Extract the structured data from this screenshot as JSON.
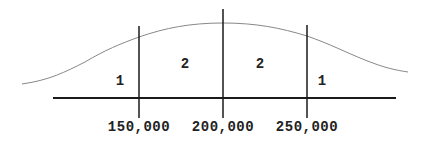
{
  "diagram": {
    "type": "normal-distribution-regions",
    "colors": {
      "line": "#1a1a1a",
      "curve": "#888888",
      "text": "#222222"
    },
    "ticks": [
      {
        "label": "150,000",
        "x": 139
      },
      {
        "label": "200,000",
        "x": 223
      },
      {
        "label": "250,000",
        "x": 307
      }
    ],
    "regions": [
      {
        "label": "1",
        "x": 120,
        "y": 85
      },
      {
        "label": "2",
        "x": 185,
        "y": 68
      },
      {
        "label": "2",
        "x": 260,
        "y": 68
      },
      {
        "label": "1",
        "x": 322,
        "y": 85
      }
    ]
  }
}
